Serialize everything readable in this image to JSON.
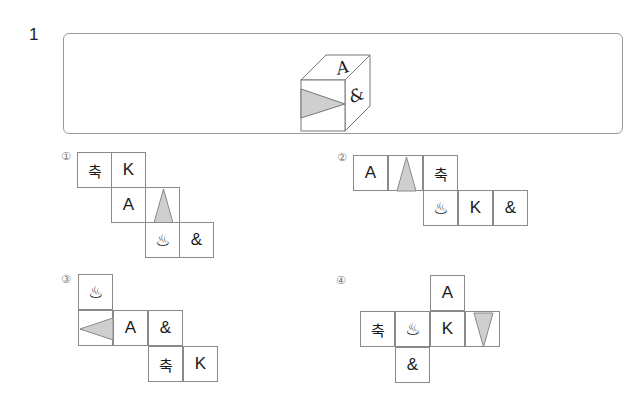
{
  "question": {
    "number": "1",
    "cube": {
      "top_face": "A",
      "right_face": "&",
      "front_face": "gray-triangle-pointing-right"
    }
  },
  "options": [
    {
      "label": "①",
      "cells": [
        {
          "text": "축",
          "kind": "ko"
        },
        {
          "text": "K",
          "kind": "latin"
        },
        {
          "text": "A",
          "kind": "latin"
        },
        {
          "text": "",
          "kind": "triangle-up"
        },
        {
          "text": "♨",
          "kind": "sym"
        },
        {
          "text": "&",
          "kind": "latin"
        }
      ]
    },
    {
      "label": "②",
      "cells": [
        {
          "text": "A",
          "kind": "latin"
        },
        {
          "text": "",
          "kind": "triangle-up"
        },
        {
          "text": "축",
          "kind": "ko"
        },
        {
          "text": "♨",
          "kind": "sym"
        },
        {
          "text": "K",
          "kind": "latin"
        },
        {
          "text": "&",
          "kind": "latin"
        }
      ]
    },
    {
      "label": "③",
      "cells": [
        {
          "text": "♨",
          "kind": "sym"
        },
        {
          "text": "",
          "kind": "triangle-left"
        },
        {
          "text": "A",
          "kind": "latin"
        },
        {
          "text": "&",
          "kind": "latin"
        },
        {
          "text": "축",
          "kind": "ko"
        },
        {
          "text": "K",
          "kind": "latin"
        }
      ]
    },
    {
      "label": "④",
      "cells": [
        {
          "text": "A",
          "kind": "latin"
        },
        {
          "text": "축",
          "kind": "ko"
        },
        {
          "text": "♨",
          "kind": "sym"
        },
        {
          "text": "K",
          "kind": "latin"
        },
        {
          "text": "",
          "kind": "triangle-down"
        },
        {
          "text": "&",
          "kind": "latin"
        }
      ]
    }
  ],
  "colors": {
    "triangle_fill": "#cfcfcf",
    "line": "#8a8a8a"
  }
}
